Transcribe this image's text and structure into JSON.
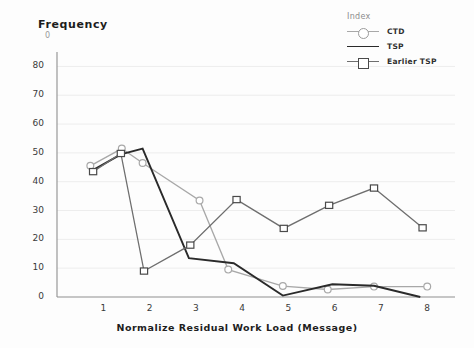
{
  "chart_data": {
    "type": "line",
    "title": "",
    "xlabel": "Normalize Residual Work Load (Message)",
    "ylabel": "Frequency",
    "ylabel_artifact": "0",
    "xlim": [
      0,
      8.6
    ],
    "ylim": [
      0,
      85
    ],
    "grid": true,
    "xticks": [
      "1",
      "2",
      "3",
      "4",
      "5",
      "6",
      "7",
      "8"
    ],
    "xtick_values": [
      1,
      2,
      3,
      4,
      5,
      6,
      7,
      8
    ],
    "yticks": [
      "0",
      "10",
      "20",
      "30",
      "40",
      "50",
      "60",
      "70",
      "80"
    ],
    "ytick_values": [
      0,
      10,
      20,
      30,
      40,
      50,
      60,
      70,
      80
    ],
    "legend_title": "Index",
    "legend_position": "top-right",
    "series": [
      {
        "name": "CTD",
        "marker": "circle",
        "color": "#a8a8a8",
        "points": [
          {
            "x": 0.72,
            "y": 45.5
          },
          {
            "x": 1.4,
            "y": 51.5
          },
          {
            "x": 1.85,
            "y": 46.5
          },
          {
            "x": 3.08,
            "y": 33.5
          },
          {
            "x": 3.7,
            "y": 9.5
          },
          {
            "x": 4.88,
            "y": 3.8
          },
          {
            "x": 5.85,
            "y": 2.6
          },
          {
            "x": 6.85,
            "y": 3.6
          },
          {
            "x": 8.0,
            "y": 3.6
          }
        ]
      },
      {
        "name": "TSP",
        "marker": "none",
        "color": "#2a2a2a",
        "points": [
          {
            "x": 0.72,
            "y": 43.5
          },
          {
            "x": 1.38,
            "y": 49.5
          },
          {
            "x": 1.85,
            "y": 51.5
          },
          {
            "x": 2.85,
            "y": 13.5
          },
          {
            "x": 3.82,
            "y": 11.7
          },
          {
            "x": 4.88,
            "y": 0.5
          },
          {
            "x": 5.95,
            "y": 4.4
          },
          {
            "x": 6.85,
            "y": 3.9
          },
          {
            "x": 7.85,
            "y": 0.0
          }
        ]
      },
      {
        "name": "Earlier TSP",
        "marker": "square",
        "color": "#6e6e6e",
        "points": [
          {
            "x": 0.78,
            "y": 43.5
          },
          {
            "x": 1.38,
            "y": 49.8
          },
          {
            "x": 1.88,
            "y": 9.0
          },
          {
            "x": 2.88,
            "y": 18.0
          },
          {
            "x": 3.88,
            "y": 33.8
          },
          {
            "x": 4.9,
            "y": 23.8
          },
          {
            "x": 5.88,
            "y": 31.8
          },
          {
            "x": 6.85,
            "y": 37.8
          },
          {
            "x": 7.9,
            "y": 24.0
          }
        ]
      }
    ]
  }
}
